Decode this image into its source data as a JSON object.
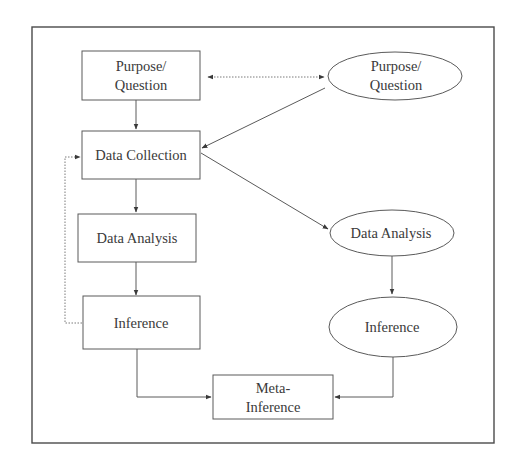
{
  "diagram": {
    "type": "flowchart",
    "left_strand": {
      "shape": "rectangle",
      "nodes": [
        {
          "id": "left-purpose",
          "lines": [
            "Purpose/",
            "Question"
          ]
        },
        {
          "id": "left-data-collection",
          "lines": [
            "Data Collection"
          ]
        },
        {
          "id": "left-data-analysis",
          "lines": [
            "Data Analysis"
          ]
        },
        {
          "id": "left-inference",
          "lines": [
            "Inference"
          ]
        }
      ]
    },
    "right_strand": {
      "shape": "ellipse",
      "nodes": [
        {
          "id": "right-purpose",
          "lines": [
            "Purpose/",
            "Question"
          ]
        },
        {
          "id": "right-data-analysis",
          "lines": [
            "Data Analysis"
          ]
        },
        {
          "id": "right-inference",
          "lines": [
            "Inference"
          ]
        }
      ]
    },
    "merge_node": {
      "id": "meta-inference",
      "shape": "rectangle",
      "lines": [
        "Meta-",
        "Inference"
      ]
    },
    "edges": [
      {
        "from": "left-purpose",
        "to": "right-purpose",
        "style": "dotted",
        "direction": "both"
      },
      {
        "from": "left-purpose",
        "to": "left-data-collection",
        "style": "solid"
      },
      {
        "from": "right-purpose",
        "to": "left-data-collection",
        "style": "solid"
      },
      {
        "from": "left-data-collection",
        "to": "left-data-analysis",
        "style": "solid"
      },
      {
        "from": "left-data-collection",
        "to": "right-data-analysis",
        "style": "solid"
      },
      {
        "from": "left-data-analysis",
        "to": "left-inference",
        "style": "solid"
      },
      {
        "from": "left-inference",
        "to": "left-data-collection",
        "style": "dotted",
        "note": "feedback loop"
      },
      {
        "from": "right-data-analysis",
        "to": "right-inference",
        "style": "solid"
      },
      {
        "from": "left-inference",
        "to": "meta-inference",
        "style": "solid"
      },
      {
        "from": "right-inference",
        "to": "meta-inference",
        "style": "solid"
      }
    ],
    "colors": {
      "stroke": "#5a5a5a",
      "text": "#3a3a3a",
      "background": "#ffffff"
    }
  },
  "labels": {
    "left_purpose_1": "Purpose/",
    "left_purpose_2": "Question",
    "left_data_collection": "Data Collection",
    "left_data_analysis": "Data Analysis",
    "left_inference": "Inference",
    "right_purpose_1": "Purpose/",
    "right_purpose_2": "Question",
    "right_data_analysis": "Data Analysis",
    "right_inference": "Inference",
    "meta_1": "Meta-",
    "meta_2": "Inference"
  }
}
